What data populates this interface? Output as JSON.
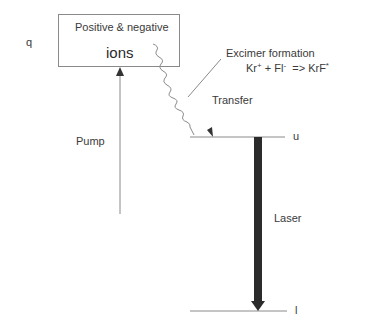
{
  "diagram": {
    "type": "energy-level diagram",
    "labels": {
      "state_q": "q",
      "box_line1": "Positive & negative",
      "box_line2": "ions",
      "pump": "Pump",
      "excimer_title": "Excimer formation",
      "reaction": {
        "kr": "Kr",
        "kr_charge": "+",
        "plus": "+",
        "fl": "Fl",
        "fl_charge": "-",
        "arrow": "=>",
        "product": "KrF",
        "product_mark": "*"
      },
      "transfer": "Transfer",
      "level_upper": "u",
      "laser": "Laser",
      "level_lower": "l"
    },
    "nodes": [
      {
        "id": "q",
        "label": "Positive & negative ions"
      },
      {
        "id": "u",
        "label": "u"
      },
      {
        "id": "l",
        "label": "l"
      }
    ],
    "edges": [
      {
        "from": "ground",
        "to": "q",
        "label": "Pump",
        "style": "thin arrow"
      },
      {
        "from": "q",
        "to": "u",
        "label": "Transfer",
        "style": "wavy arrow"
      },
      {
        "from": "u",
        "to": "l",
        "label": "Laser",
        "style": "thick arrow"
      }
    ],
    "colors": {
      "line": "#8a8a8a",
      "laser_arrow": "#2b2b2b",
      "text": "#3a3a3a"
    }
  }
}
